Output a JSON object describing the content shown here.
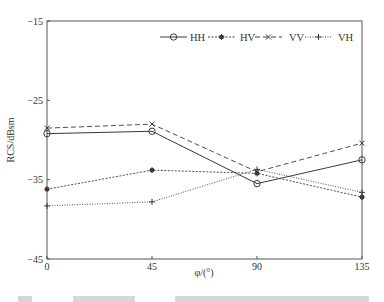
{
  "chart_data": {
    "type": "line",
    "title": "",
    "xlabel": "φ/(°)",
    "ylabel": "RCS/dBsm",
    "x": [
      0,
      45,
      90,
      135
    ],
    "xticks": [
      "0",
      "45",
      "90",
      "135"
    ],
    "yticks": [
      "−15",
      "−25",
      "−35",
      "−45"
    ],
    "ytick_values": [
      -15,
      -25,
      -35,
      -45
    ],
    "xlim": [
      0,
      135
    ],
    "ylim": [
      -45,
      -15
    ],
    "grid": false,
    "legend_position": "top-right (inside, horizontal)",
    "series": [
      {
        "name": "HH",
        "marker": "circle",
        "linestyle": "solid",
        "values": [
          -29.2,
          -28.9,
          -35.5,
          -32.5
        ]
      },
      {
        "name": "HV",
        "marker": "asterisk",
        "linestyle": "dotted",
        "values": [
          -36.2,
          -33.8,
          -34.2,
          -37.2
        ]
      },
      {
        "name": "VV",
        "marker": "x",
        "linestyle": "dashed",
        "values": [
          -28.5,
          -28.0,
          -34.0,
          -30.4
        ]
      },
      {
        "name": "VH",
        "marker": "plus",
        "linestyle": "fine-dotted",
        "values": [
          -38.3,
          -37.8,
          -33.7,
          -36.6
        ]
      }
    ]
  },
  "legend": {
    "items": [
      {
        "label": "HH"
      },
      {
        "label": "HV"
      },
      {
        "label": "VV"
      },
      {
        "label": "VH"
      }
    ]
  },
  "axes": {
    "x_label": "φ/(°)",
    "y_label": "RCS/dBsm"
  },
  "colors": {
    "line": "#3a3a3a",
    "axis": "#555555"
  }
}
